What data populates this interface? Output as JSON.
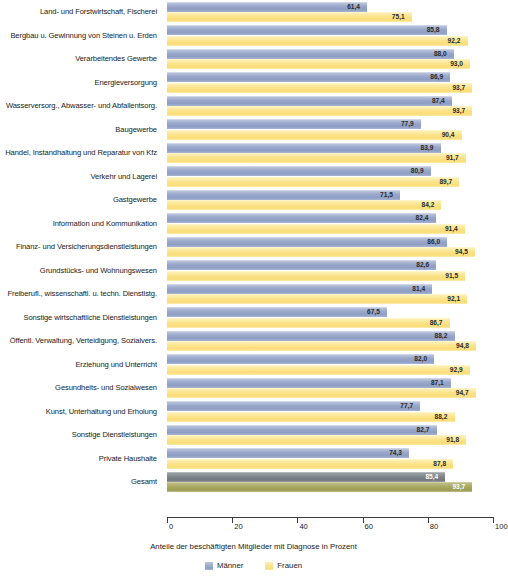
{
  "chart_data": {
    "type": "bar",
    "orientation": "horizontal",
    "title": "",
    "xlabel": "Anteile der beschäftigten Mitglieder mit Diagnose in Prozent",
    "ylabel": "",
    "xlim": [
      0,
      100
    ],
    "xticks": [
      0,
      20,
      40,
      60,
      80,
      100
    ],
    "xtick_labels": [
      "0",
      "20",
      "40",
      "60",
      "80",
      "100"
    ],
    "grid": false,
    "legend_position": "bottom-center",
    "decimal_separator": ",",
    "categories": [
      "Land- und Forstwirtschaft, Fischerei",
      "Bergbau u. Gewinnung von Steinen u. Erden",
      "Verarbeitendes Gewerbe",
      "Energieversorgung",
      "Wasserversorg., Abwasser- und Abfallentsorg.",
      "Baugewerbe",
      "Handel, Instandhaltung und Reparatur von Kfz",
      "Verkehr und Lagerei",
      "Gastgewerbe",
      "Information und Kommunikation",
      "Finanz- und Versicherungsdienstleistungen",
      "Grundstücks- und Wohnungswesen",
      "Freiberufl., wissenschaftl. u. techn. Dienstlstg.",
      "Sonstige wirtschaftliche Dienstleistungen",
      "Öffentl. Verwaltung, Verteidigung, Sozialvers.",
      "Erziehung und Unterricht",
      "Gesundheits- und Sozialwesen",
      "Kunst, Unterhaltung und Erholung",
      "Sonstige Dienstleistungen",
      "Private Haushalte",
      "Gesamt"
    ],
    "series": [
      {
        "name": "Männer",
        "color": "#8e9ec4",
        "values": [
          61.4,
          85.8,
          88.0,
          86.9,
          87.4,
          77.9,
          83.9,
          80.9,
          71.5,
          82.4,
          86.0,
          82.6,
          81.4,
          67.5,
          88.2,
          82.0,
          87.1,
          77.7,
          82.7,
          74.3,
          85.4
        ],
        "labels": [
          "61,4",
          "85,8",
          "88,0",
          "86,9",
          "87,4",
          "77,9",
          "83,9",
          "80,9",
          "71,5",
          "82,4",
          "86,0",
          "82,6",
          "81,4",
          "67,5",
          "88,2",
          "82,0",
          "87,1",
          "77,7",
          "82,7",
          "74,3",
          "85,4"
        ]
      },
      {
        "name": "Frauen",
        "color": "#f9dd78",
        "values": [
          75.1,
          92.2,
          93.0,
          93.7,
          93.7,
          90.4,
          91.7,
          89.7,
          84.2,
          91.4,
          94.5,
          91.5,
          92.1,
          86.7,
          94.8,
          92.9,
          94.7,
          88.2,
          91.8,
          87.8,
          93.7
        ],
        "labels": [
          "75,1",
          "92,2",
          "93,0",
          "93,7",
          "93,7",
          "90,4",
          "91,7",
          "89,7",
          "84,2",
          "91,4",
          "94,5",
          "91,5",
          "92,1",
          "86,7",
          "94,8",
          "92,9",
          "94,7",
          "88,2",
          "91,8",
          "87,8",
          "93,7"
        ]
      }
    ],
    "total_row_index": 20,
    "total_colors": {
      "maenner": "#7d858b",
      "frauen": "#a9a860"
    }
  },
  "legend": {
    "items": [
      {
        "label": "Männer",
        "swatch": "m"
      },
      {
        "label": "Frauen",
        "swatch": "f"
      }
    ]
  }
}
